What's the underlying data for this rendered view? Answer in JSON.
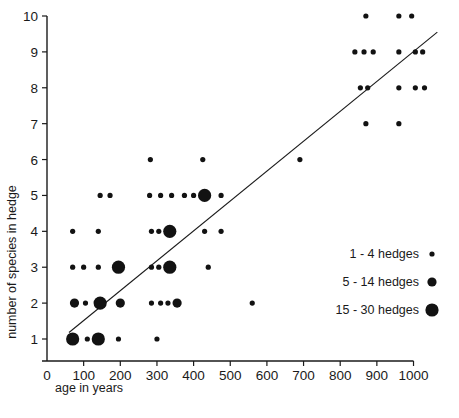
{
  "chart_data": {
    "type": "scatter",
    "title": "",
    "xlabel": "age in years",
    "ylabel": "number of species in hedge",
    "xlim": [
      0,
      1075
    ],
    "ylim": [
      0.3,
      10.4
    ],
    "grid": false,
    "xticks": [
      0,
      100,
      200,
      300,
      400,
      500,
      600,
      700,
      800,
      900,
      1000
    ],
    "xtick_labels": [
      "0",
      "100",
      "200",
      "300",
      "400",
      "500",
      "600",
      "700",
      "800",
      "900",
      "1000"
    ],
    "yticks": [
      1,
      2,
      3,
      4,
      5,
      6,
      7,
      8,
      9,
      10
    ],
    "ytick_labels": [
      "1",
      "2",
      "3",
      "4",
      "5",
      "6",
      "7",
      "8",
      "9",
      "10"
    ],
    "size_encoding": "marker area encodes number of hedges sampled",
    "legend_position": "inside-lower-right",
    "legend": [
      {
        "label": "1 - 4 hedges",
        "size_class": "small",
        "radius_px": 2.6
      },
      {
        "label": "5 - 14 hedges",
        "size_class": "medium",
        "radius_px": 4.6
      },
      {
        "label": "15 - 30 hedges",
        "size_class": "large",
        "radius_px": 6.6
      }
    ],
    "regression_line": {
      "x": [
        60,
        1065
      ],
      "y": [
        1.18,
        9.55
      ]
    },
    "points": [
      {
        "x": 70,
        "y": 1,
        "size": "large"
      },
      {
        "x": 110,
        "y": 1,
        "size": "small"
      },
      {
        "x": 140,
        "y": 1,
        "size": "large"
      },
      {
        "x": 195,
        "y": 1,
        "size": "small"
      },
      {
        "x": 300,
        "y": 1,
        "size": "small"
      },
      {
        "x": 75,
        "y": 2,
        "size": "medium"
      },
      {
        "x": 105,
        "y": 2,
        "size": "small"
      },
      {
        "x": 145,
        "y": 2,
        "size": "large"
      },
      {
        "x": 200,
        "y": 2,
        "size": "medium"
      },
      {
        "x": 285,
        "y": 2,
        "size": "small"
      },
      {
        "x": 310,
        "y": 2,
        "size": "small"
      },
      {
        "x": 330,
        "y": 2,
        "size": "small"
      },
      {
        "x": 355,
        "y": 2,
        "size": "medium"
      },
      {
        "x": 560,
        "y": 2,
        "size": "small"
      },
      {
        "x": 70,
        "y": 3,
        "size": "small"
      },
      {
        "x": 100,
        "y": 3,
        "size": "small"
      },
      {
        "x": 140,
        "y": 3,
        "size": "small"
      },
      {
        "x": 195,
        "y": 3,
        "size": "large"
      },
      {
        "x": 285,
        "y": 3,
        "size": "small"
      },
      {
        "x": 305,
        "y": 3,
        "size": "small"
      },
      {
        "x": 335,
        "y": 3,
        "size": "large"
      },
      {
        "x": 440,
        "y": 3,
        "size": "small"
      },
      {
        "x": 70,
        "y": 4,
        "size": "small"
      },
      {
        "x": 140,
        "y": 4,
        "size": "small"
      },
      {
        "x": 285,
        "y": 4,
        "size": "small"
      },
      {
        "x": 305,
        "y": 4,
        "size": "small"
      },
      {
        "x": 335,
        "y": 4,
        "size": "large"
      },
      {
        "x": 430,
        "y": 4,
        "size": "small"
      },
      {
        "x": 475,
        "y": 4,
        "size": "small"
      },
      {
        "x": 145,
        "y": 5,
        "size": "small"
      },
      {
        "x": 172,
        "y": 5,
        "size": "small"
      },
      {
        "x": 280,
        "y": 5,
        "size": "small"
      },
      {
        "x": 310,
        "y": 5,
        "size": "small"
      },
      {
        "x": 340,
        "y": 5,
        "size": "small"
      },
      {
        "x": 375,
        "y": 5,
        "size": "small"
      },
      {
        "x": 400,
        "y": 5,
        "size": "small"
      },
      {
        "x": 430,
        "y": 5,
        "size": "large"
      },
      {
        "x": 475,
        "y": 5,
        "size": "small"
      },
      {
        "x": 282,
        "y": 6,
        "size": "small"
      },
      {
        "x": 425,
        "y": 6,
        "size": "small"
      },
      {
        "x": 690,
        "y": 6,
        "size": "small"
      },
      {
        "x": 870,
        "y": 7,
        "size": "small"
      },
      {
        "x": 960,
        "y": 7,
        "size": "small"
      },
      {
        "x": 855,
        "y": 8,
        "size": "small"
      },
      {
        "x": 875,
        "y": 8,
        "size": "small"
      },
      {
        "x": 960,
        "y": 8,
        "size": "small"
      },
      {
        "x": 1005,
        "y": 8,
        "size": "small"
      },
      {
        "x": 1030,
        "y": 8,
        "size": "small"
      },
      {
        "x": 840,
        "y": 9,
        "size": "small"
      },
      {
        "x": 865,
        "y": 9,
        "size": "small"
      },
      {
        "x": 890,
        "y": 9,
        "size": "small"
      },
      {
        "x": 960,
        "y": 9,
        "size": "small"
      },
      {
        "x": 1005,
        "y": 9,
        "size": "small"
      },
      {
        "x": 1025,
        "y": 9,
        "size": "small"
      },
      {
        "x": 870,
        "y": 10,
        "size": "small"
      },
      {
        "x": 960,
        "y": 10,
        "size": "small"
      },
      {
        "x": 995,
        "y": 10,
        "size": "small"
      }
    ]
  }
}
